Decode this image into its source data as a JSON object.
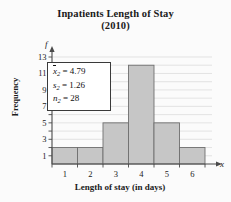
{
  "chart_data": {
    "type": "bar",
    "title": "Inpatients Length of Stay (2010)",
    "title_line1": "Inpatients Length of Stay",
    "title_line2": "(2010)",
    "xlabel": "Length of stay (in days)",
    "ylabel": "Frequency",
    "x_axis_symbol": "x",
    "y_axis_symbol": "f",
    "categories": [
      "1",
      "2",
      "3",
      "4",
      "5",
      "6"
    ],
    "values": [
      2,
      2,
      5,
      12,
      5,
      2
    ],
    "ylim": [
      0,
      13
    ],
    "xlim": [
      0.5,
      6.5
    ],
    "y_tick_labels": [
      "1",
      "3",
      "5",
      "7",
      "9",
      "11",
      "13"
    ],
    "y_tick_values": [
      1,
      3,
      5,
      7,
      9,
      11,
      13
    ],
    "y_gridline_values": [
      1,
      2,
      3,
      4,
      5,
      6,
      7,
      8,
      9,
      10,
      11,
      12,
      13
    ],
    "x_tick_labels": [
      "1",
      "2",
      "3",
      "4",
      "5",
      "6"
    ],
    "grid": true,
    "legend": false,
    "bar_fill": "#c6c6c6",
    "bar_stroke": "#6f6f6f",
    "grid_color": "#d8d8d8",
    "axis_color": "#4a4a4a",
    "background": "#fbfbfb"
  },
  "stats_box": {
    "rows": [
      {
        "symbol": "x",
        "overbar": true,
        "subscript": "2",
        "equals": "=",
        "value": "4.79"
      },
      {
        "symbol": "s",
        "overbar": false,
        "subscript": "2",
        "equals": "=",
        "value": "1.26"
      },
      {
        "symbol": "n",
        "overbar": false,
        "subscript": "2",
        "equals": "=",
        "value": "28"
      }
    ],
    "mean_label": "x̅2 = 4.79",
    "sd_label": "s2 = 1.26",
    "n_label": "n2 = 28"
  }
}
